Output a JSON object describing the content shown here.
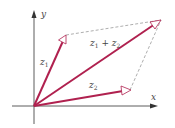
{
  "diagram": {
    "colors": {
      "vector": "#b0214f",
      "axis": "#333333",
      "dashed": "#777777",
      "text": "#444444"
    },
    "axes": {
      "x_label": "x",
      "y_label": "y"
    },
    "vectors": [
      {
        "name": "z1",
        "label_main": "z",
        "label_sub": "1"
      },
      {
        "name": "z2",
        "label_main": "z",
        "label_sub": "2"
      },
      {
        "name": "z1+z2",
        "label_a": "z",
        "label_a_sub": "1",
        "label_op": " + ",
        "label_b": "z",
        "label_b_sub": "2"
      }
    ]
  }
}
